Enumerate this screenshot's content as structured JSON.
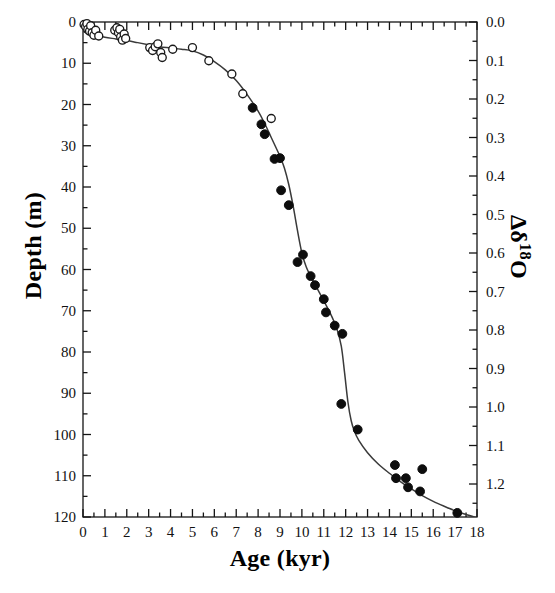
{
  "chart_data": {
    "type": "scatter",
    "title": "",
    "xlabel": "Age (kyr)",
    "ylabel": "Depth (m)",
    "y2label": "Δδ¹⁸O",
    "xlim": [
      0,
      18
    ],
    "ylim": [
      120,
      0
    ],
    "y2lim": [
      1.2857,
      0.0
    ],
    "grid": false,
    "legend": "none",
    "x_ticks": [
      0,
      1,
      2,
      3,
      4,
      5,
      6,
      7,
      8,
      9,
      10,
      11,
      12,
      13,
      14,
      15,
      16,
      17,
      18
    ],
    "x_tick_labels": [
      "0",
      "1",
      "2",
      "3",
      "4",
      "5",
      "6",
      "7",
      "8",
      "9",
      "10",
      "11",
      "12",
      "13",
      "14",
      "15",
      "16",
      "17",
      "18"
    ],
    "x_minor_step": 0.5,
    "y_ticks": [
      0,
      10,
      20,
      30,
      40,
      50,
      60,
      70,
      80,
      90,
      100,
      110,
      120
    ],
    "y_tick_labels": [
      "0",
      "10",
      "20",
      "30",
      "40",
      "50",
      "60",
      "70",
      "80",
      "90",
      "100",
      "110",
      "120"
    ],
    "y_minor_step": 5,
    "y2_ticks": [
      0.0,
      0.1,
      0.2,
      0.3,
      0.4,
      0.5,
      0.6,
      0.7,
      0.8,
      0.9,
      1.0,
      1.1,
      1.2
    ],
    "y2_tick_labels": [
      "0.0",
      "0.1",
      "0.2",
      "0.3",
      "0.4",
      "0.5",
      "0.6",
      "0.7",
      "0.8",
      "0.9",
      "1.0",
      "1.1",
      "1.2"
    ],
    "y2_minor_step": 0.05,
    "series": [
      {
        "name": "open-circles",
        "marker": "open-circle",
        "color": "#1a1a1a",
        "points": [
          [
            0.05,
            0.6
          ],
          [
            0.12,
            1.1
          ],
          [
            0.18,
            0.4
          ],
          [
            0.22,
            1.8
          ],
          [
            0.3,
            2.2
          ],
          [
            0.35,
            0.9
          ],
          [
            0.42,
            2.6
          ],
          [
            0.5,
            3.2
          ],
          [
            0.58,
            2.0
          ],
          [
            0.72,
            3.4
          ],
          [
            1.45,
            2.0
          ],
          [
            1.55,
            1.4
          ],
          [
            1.62,
            2.6
          ],
          [
            1.68,
            1.8
          ],
          [
            1.72,
            3.6
          ],
          [
            1.8,
            4.4
          ],
          [
            1.88,
            2.9
          ],
          [
            1.95,
            4.0
          ],
          [
            3.05,
            6.2
          ],
          [
            3.18,
            6.9
          ],
          [
            3.3,
            6.0
          ],
          [
            3.42,
            5.3
          ],
          [
            3.55,
            7.4
          ],
          [
            3.62,
            8.6
          ],
          [
            4.1,
            6.6
          ],
          [
            5.0,
            6.2
          ],
          [
            5.75,
            9.4
          ],
          [
            6.8,
            12.6
          ],
          [
            7.3,
            17.4
          ],
          [
            8.6,
            23.4
          ]
        ]
      },
      {
        "name": "filled-circles",
        "marker": "filled-circle",
        "color": "#0d0d0d",
        "points": [
          [
            7.75,
            20.8
          ],
          [
            8.15,
            24.8
          ],
          [
            8.3,
            27.2
          ],
          [
            8.75,
            33.2
          ],
          [
            9.0,
            33.0
          ],
          [
            9.05,
            40.8
          ],
          [
            9.4,
            44.4
          ],
          [
            9.8,
            58.2
          ],
          [
            10.05,
            56.4
          ],
          [
            10.4,
            61.6
          ],
          [
            10.6,
            63.8
          ],
          [
            11.0,
            67.2
          ],
          [
            11.1,
            70.4
          ],
          [
            11.5,
            73.6
          ],
          [
            11.85,
            75.6
          ],
          [
            11.8,
            92.6
          ],
          [
            12.55,
            98.8
          ],
          [
            14.25,
            107.4
          ],
          [
            14.3,
            110.6
          ],
          [
            14.75,
            110.6
          ],
          [
            14.85,
            112.8
          ],
          [
            15.4,
            113.8
          ],
          [
            15.5,
            108.4
          ],
          [
            17.1,
            119.0
          ]
        ]
      }
    ],
    "fit_curve": {
      "name": "age-depth-model",
      "color": "#3a3a3a",
      "points": [
        [
          0.0,
          2.3
        ],
        [
          0.5,
          3.2
        ],
        [
          1.0,
          3.7
        ],
        [
          1.5,
          4.1
        ],
        [
          2.0,
          4.5
        ],
        [
          2.5,
          5.0
        ],
        [
          3.0,
          5.5
        ],
        [
          3.5,
          6.0
        ],
        [
          4.0,
          6.3
        ],
        [
          4.5,
          6.6
        ],
        [
          5.0,
          7.0
        ],
        [
          5.5,
          8.0
        ],
        [
          6.0,
          9.6
        ],
        [
          6.5,
          11.6
        ],
        [
          7.0,
          14.2
        ],
        [
          7.5,
          17.6
        ],
        [
          8.0,
          21.6
        ],
        [
          8.3,
          24.6
        ],
        [
          8.6,
          28.0
        ],
        [
          8.9,
          31.4
        ],
        [
          9.0,
          32.6
        ],
        [
          9.2,
          35.4
        ],
        [
          9.4,
          39.4
        ],
        [
          9.6,
          44.6
        ],
        [
          9.8,
          50.6
        ],
        [
          10.0,
          56.0
        ],
        [
          10.2,
          59.4
        ],
        [
          10.4,
          61.6
        ],
        [
          10.6,
          63.6
        ],
        [
          10.8,
          65.6
        ],
        [
          11.0,
          67.6
        ],
        [
          11.2,
          69.6
        ],
        [
          11.4,
          71.8
        ],
        [
          11.6,
          74.4
        ],
        [
          11.8,
          78.6
        ],
        [
          11.95,
          85.0
        ],
        [
          12.1,
          92.0
        ],
        [
          12.25,
          96.6
        ],
        [
          12.4,
          99.2
        ],
        [
          12.6,
          101.4
        ],
        [
          13.0,
          104.4
        ],
        [
          13.5,
          107.2
        ],
        [
          14.0,
          109.4
        ],
        [
          14.5,
          111.4
        ],
        [
          15.0,
          113.2
        ],
        [
          15.5,
          114.8
        ],
        [
          16.0,
          116.2
        ],
        [
          16.5,
          117.4
        ],
        [
          17.0,
          118.5
        ],
        [
          17.5,
          119.4
        ],
        [
          18.0,
          120.2
        ]
      ]
    }
  },
  "axes": {
    "x_title": "Age (kyr)",
    "y_title": "Depth (m)",
    "y2_title_delta": "Δδ",
    "y2_title_sup": "18",
    "y2_title_o": "O"
  }
}
